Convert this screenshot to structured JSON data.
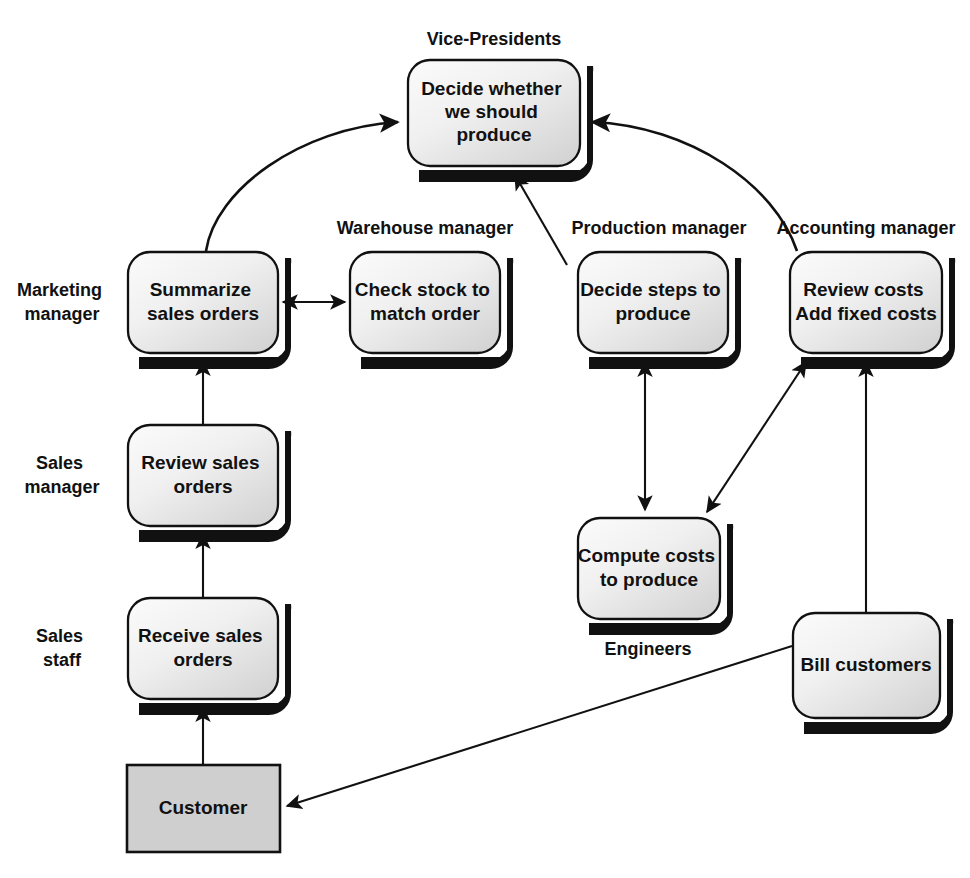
{
  "diagram": {
    "background_color": "#ffffff",
    "line_color": "#111111",
    "text_color": "#111111",
    "box_fill_light": "#fafafa",
    "box_fill_dark": "#d6d6d6",
    "external_entity_fill": "#cfcfcf"
  },
  "roles": [
    {
      "id": "role-vice-presidents",
      "label": "Vice-Presidents",
      "x": 494,
      "y": 40,
      "lines": [
        "Vice-Presidents"
      ]
    },
    {
      "id": "role-warehouse-manager",
      "label": "Warehouse manager",
      "x": 425,
      "y": 229,
      "lines": [
        "Warehouse manager"
      ]
    },
    {
      "id": "role-production-manager",
      "label": "Production manager",
      "x": 659,
      "y": 229,
      "lines": [
        "Production manager"
      ]
    },
    {
      "id": "role-accounting-manager",
      "label": "Accounting manager",
      "x": 866,
      "y": 229,
      "lines": [
        "Accounting manager"
      ]
    },
    {
      "id": "role-marketing-manager",
      "label": "Marketing manager",
      "x": 62,
      "y": 302,
      "lines": [
        "Marketing",
        "manager"
      ]
    },
    {
      "id": "role-sales-manager",
      "label": "Sales manager",
      "x": 62,
      "y": 475,
      "lines": [
        "Sales",
        "manager"
      ]
    },
    {
      "id": "role-sales-staff",
      "label": "Sales staff",
      "x": 62,
      "y": 648,
      "lines": [
        "Sales",
        "staff"
      ]
    },
    {
      "id": "role-engineers",
      "label": "Engineers",
      "x": 648,
      "y": 650,
      "lines": [
        "Engineers"
      ]
    }
  ],
  "nodes": [
    {
      "id": "node-decide-whether-produce",
      "label": "Decide whether we should produce",
      "lines": [
        "Decide whether",
        "we should",
        "produce"
      ],
      "shape": "rounded",
      "x": 408,
      "y": 60,
      "w": 172,
      "h": 106
    },
    {
      "id": "node-summarize-sales-orders",
      "label": "Summarize sales orders",
      "lines": [
        "Summarize",
        "sales orders"
      ],
      "shape": "rounded",
      "x": 128,
      "y": 252,
      "w": 150,
      "h": 101
    },
    {
      "id": "node-check-stock",
      "label": "Check stock to match order",
      "lines": [
        "Check stock to",
        "match order"
      ],
      "shape": "rounded",
      "x": 350,
      "y": 252,
      "w": 150,
      "h": 101
    },
    {
      "id": "node-decide-steps-produce",
      "label": "Decide steps to produce",
      "lines": [
        "Decide steps to",
        "produce"
      ],
      "shape": "rounded",
      "x": 578,
      "y": 252,
      "w": 150,
      "h": 101
    },
    {
      "id": "node-review-costs",
      "label": "Review costs Add fixed costs",
      "lines": [
        "Review costs",
        "Add fixed costs"
      ],
      "shape": "rounded",
      "x": 790,
      "y": 252,
      "w": 152,
      "h": 101
    },
    {
      "id": "node-review-sales-orders",
      "label": "Review sales orders",
      "lines": [
        "Review sales",
        "orders"
      ],
      "shape": "rounded",
      "x": 128,
      "y": 425,
      "w": 150,
      "h": 101
    },
    {
      "id": "node-compute-costs",
      "label": "Compute costs to produce",
      "lines": [
        "Compute costs",
        "to produce"
      ],
      "shape": "rounded",
      "x": 578,
      "y": 518,
      "w": 142,
      "h": 101
    },
    {
      "id": "node-receive-sales-orders",
      "label": "Receive sales orders",
      "lines": [
        "Receive sales",
        "orders"
      ],
      "shape": "rounded",
      "x": 128,
      "y": 598,
      "w": 150,
      "h": 101
    },
    {
      "id": "node-bill-customers",
      "label": "Bill customers",
      "lines": [
        "Bill customers"
      ],
      "shape": "rounded",
      "x": 793,
      "y": 613,
      "w": 147,
      "h": 105
    },
    {
      "id": "node-customer",
      "label": "Customer",
      "lines": [
        "Customer"
      ],
      "shape": "rectangle",
      "x": 127,
      "y": 765,
      "w": 153,
      "h": 87
    }
  ],
  "edges": [
    {
      "id": "edge-customer-to-receive",
      "from": "node-customer",
      "to": "node-receive-sales-orders",
      "style": "straight",
      "arrows": "end"
    },
    {
      "id": "edge-receive-to-review",
      "from": "node-receive-sales-orders",
      "to": "node-review-sales-orders",
      "style": "straight",
      "arrows": "end"
    },
    {
      "id": "edge-review-to-summarize",
      "from": "node-review-sales-orders",
      "to": "node-summarize-sales-orders",
      "style": "straight",
      "arrows": "end"
    },
    {
      "id": "edge-summarize-to-checkstock",
      "from": "node-summarize-sales-orders",
      "to": "node-check-stock",
      "style": "straight",
      "arrows": "both"
    },
    {
      "id": "edge-summarize-to-decide-produce",
      "from": "node-summarize-sales-orders",
      "to": "node-decide-whether-produce",
      "style": "curved",
      "arrows": "end"
    },
    {
      "id": "edge-decide-steps-to-decide-produce",
      "from": "node-decide-steps-produce",
      "to": "node-decide-whether-produce",
      "style": "straight",
      "arrows": "end"
    },
    {
      "id": "edge-review-costs-to-decide-produce",
      "from": "node-review-costs",
      "to": "node-decide-whether-produce",
      "style": "curved",
      "arrows": "end"
    },
    {
      "id": "edge-decide-steps-to-compute-costs",
      "from": "node-decide-steps-produce",
      "to": "node-compute-costs",
      "style": "straight",
      "arrows": "both"
    },
    {
      "id": "edge-compute-costs-to-review-costs",
      "from": "node-compute-costs",
      "to": "node-review-costs",
      "style": "straight",
      "arrows": "both"
    },
    {
      "id": "edge-bill-customers-to-review-costs",
      "from": "node-bill-customers",
      "to": "node-review-costs",
      "style": "straight",
      "arrows": "end"
    },
    {
      "id": "edge-bill-customers-to-customer",
      "from": "node-bill-customers",
      "to": "node-customer",
      "style": "straight",
      "arrows": "end"
    }
  ]
}
